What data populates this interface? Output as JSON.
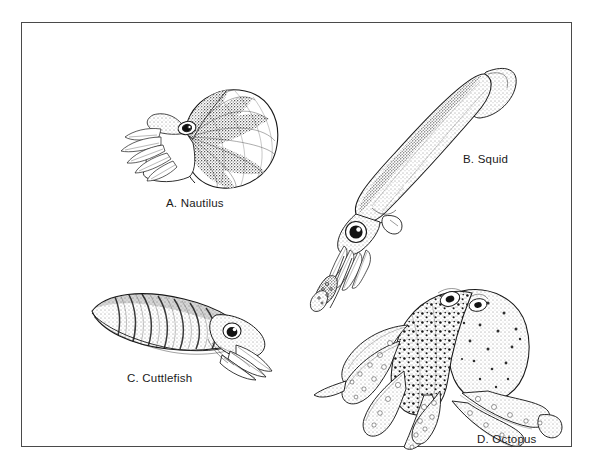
{
  "figure": {
    "type": "scientific-illustration-plate",
    "medium": "black-and-white line drawing with stipple shading",
    "background_color": "#ffffff",
    "ink_color": "#1a1a1a",
    "frame_color": "#4a4a4a",
    "frame": {
      "x": 21,
      "y": 22,
      "width": 551,
      "height": 425,
      "border_width_px": 1.2
    },
    "specimens": [
      {
        "key": "nautilus",
        "letter": "A.",
        "name": "Nautilus",
        "caption": "A.  Nautilus",
        "position": "top-left",
        "caption_position": {
          "x": 144,
          "y": 174
        },
        "art_box": {
          "x": 95,
          "y": 50,
          "width": 165,
          "height": 125
        },
        "description": "Coiled chambered shell with radiating dark stripes, hood and numerous short tentacles at left, single visible eye"
      },
      {
        "key": "squid",
        "letter": "B.",
        "name": "Squid",
        "caption": "B.  Squid",
        "position": "top-right",
        "caption_position": {
          "x": 441,
          "y": 130
        },
        "art_box": {
          "x": 288,
          "y": 33,
          "width": 215,
          "height": 252
        },
        "description": "Elongate torpedo-shaped mantle oriented diagonally, terminal fin at upper right, large eye, eight arms and two long tentacles with clubs trailing to lower left"
      },
      {
        "key": "cuttlefish",
        "letter": "C.",
        "name": "Cuttlefish",
        "caption": "C.  Cuttlefish",
        "position": "bottom-left",
        "caption_position": {
          "x": 105,
          "y": 349
        },
        "art_box": {
          "x": 58,
          "y": 258,
          "width": 195,
          "height": 100
        },
        "description": "Broad flattened oval mantle with lateral fin fringe and banded dorsal stripes, prominent eye at right, arms held together pointing right"
      },
      {
        "key": "octopus",
        "letter": "D.",
        "name": "Octopus",
        "caption": "D.  Octopus",
        "position": "bottom-right",
        "caption_position": {
          "x": 455,
          "y": 410
        },
        "art_box": {
          "x": 290,
          "y": 252,
          "width": 262,
          "height": 180
        },
        "description": "Bulbous warty mantle with two eyes on top, eight long sinuous arms with visible suckers curling outward and downward"
      }
    ]
  }
}
